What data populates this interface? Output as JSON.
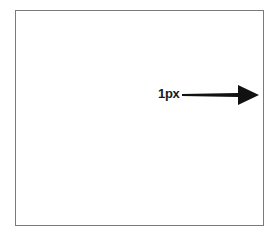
{
  "diagram": {
    "label": "1px",
    "arrow_direction": "right",
    "arrow_icon": "arrow-right-icon",
    "colors": {
      "border": "#7a7a7a",
      "arrow": "#111111",
      "text": "#1a1a1a",
      "background": "#ffffff"
    }
  }
}
